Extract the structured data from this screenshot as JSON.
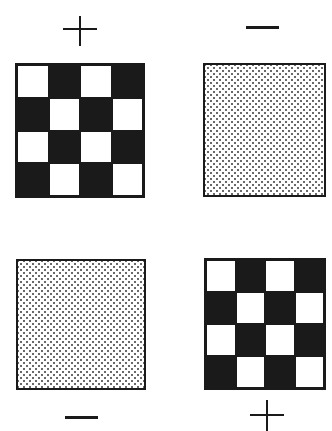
{
  "figure": {
    "panels": [
      {
        "id": "top-left",
        "pattern": "checkerboard",
        "sign": "+",
        "sign_position": "above",
        "grid": [
          4,
          4
        ],
        "first_cell": "white"
      },
      {
        "id": "top-right",
        "pattern": "dotted",
        "sign": "−",
        "sign_position": "above"
      },
      {
        "id": "bottom-left",
        "pattern": "dotted",
        "sign": "−",
        "sign_position": "below"
      },
      {
        "id": "bottom-right",
        "pattern": "checkerboard",
        "sign": "+",
        "sign_position": "below",
        "grid": [
          4,
          4
        ],
        "first_cell": "white"
      }
    ],
    "colors": {
      "ink": "#1a1a1a",
      "background": "#ffffff",
      "dot": "#6a6a6a"
    }
  }
}
